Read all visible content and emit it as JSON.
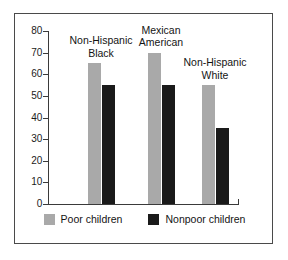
{
  "chart_data": {
    "type": "bar",
    "title": "",
    "xlabel": "",
    "ylabel": "",
    "ylim": [
      0,
      80
    ],
    "ytick_values": [
      80,
      70,
      60,
      50,
      40,
      30,
      20,
      10,
      0
    ],
    "ytick_labels": [
      "80",
      "70",
      "60",
      "50",
      "40",
      "30",
      "20",
      "10",
      "0"
    ],
    "grid": false,
    "legend_position": "bottom",
    "categories": [
      "Non-Hispanic Black",
      "Mexican American",
      "Non-Hispanic White"
    ],
    "category_label_lines": [
      [
        "Non-Hispanic",
        "Black"
      ],
      [
        "Mexican",
        "American"
      ],
      [
        "Non-Hispanic",
        "White"
      ]
    ],
    "series": [
      {
        "name": "Poor children",
        "color": "#a9a9a9",
        "values": [
          65,
          70,
          55
        ]
      },
      {
        "name": "Nonpoor children",
        "color": "#1a1a1a",
        "values": [
          55,
          55,
          35
        ]
      }
    ]
  },
  "legend": {
    "items": [
      {
        "label": "Poor children",
        "color": "#a9a9a9"
      },
      {
        "label": "Nonpoor children",
        "color": "#1a1a1a"
      }
    ]
  },
  "colors": {
    "poor": "#a9a9a9",
    "nonpoor": "#1a1a1a",
    "axis": "#3a3a3a",
    "frame": "#4a4a4a",
    "text": "#141414",
    "background": "#ffffff"
  }
}
